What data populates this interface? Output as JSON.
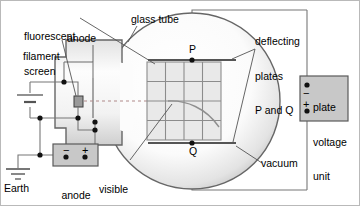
{
  "figure": {
    "border_color": "#b9b9b9",
    "background": "#ffffff"
  },
  "colors": {
    "wire": "#777777",
    "outline": "#555555",
    "glass": "#666666",
    "grid_fill": "#e9e9e9",
    "grid_line": "#8c8c8c",
    "box_fill": "#c8c8c8",
    "box_stroke": "#5a5a5a",
    "plate": "#555555",
    "trace": "#8f8f8f",
    "beam_dash": "#a07a7a",
    "node": "#111111",
    "text": "#000000"
  },
  "labels": {
    "fluorescent_screen": {
      "line1": "fluorescent",
      "line2": "screen"
    },
    "anode": "anode",
    "filament": "filament",
    "glass_tube": "glass tube",
    "deflecting_plates": {
      "line1": "deflecting",
      "line2": "plates",
      "line3": "P and Q"
    },
    "plate_p": "P",
    "plate_q": "Q",
    "vacuum": "vacuum",
    "earth": "Earth",
    "anode_voltage_unit": {
      "line1": "anode",
      "line2": "voltage",
      "line3": "unit"
    },
    "visible_trace": {
      "line1": "visible",
      "line2": "trace on",
      "line3": "screen"
    },
    "plate_voltage_unit": {
      "line1": "plate",
      "line2": "voltage",
      "line3": "unit"
    }
  },
  "polarity": {
    "anode_minus": "−",
    "anode_plus": "+",
    "plate_minus": "−",
    "plate_plus": "+"
  },
  "screen_grid": {
    "columns": 4,
    "rows": 4,
    "x": 147,
    "y": 62,
    "width": 74,
    "height": 78
  },
  "icons": {
    "earth_ground": "earth-ground-icon",
    "battery": "battery-cell-icon",
    "terminal_node": "terminal-node-icon"
  }
}
